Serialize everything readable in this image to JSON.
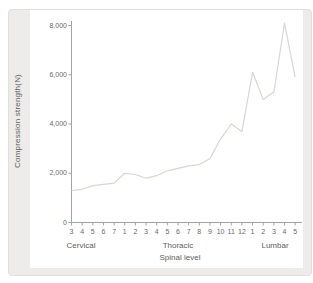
{
  "panel": {
    "background_color": "#edecea",
    "plot_background_color": "#ffffff"
  },
  "chart_data": {
    "type": "line",
    "title": "",
    "ylabel": "Compression strength(N)",
    "xlabel": "Spinal level",
    "ylim": [
      0,
      8220
    ],
    "yticks": [
      0,
      2000,
      4000,
      6000,
      8000
    ],
    "ytick_labels": [
      "0",
      "2,000",
      "4,000",
      "6,000",
      "8,000"
    ],
    "groups": [
      {
        "label": "Cervical",
        "ticks": [
          "3",
          "4",
          "5",
          "6",
          "7"
        ]
      },
      {
        "label": "Thoracic",
        "ticks": [
          "1",
          "2",
          "3",
          "4",
          "5",
          "6",
          "7",
          "8",
          "9",
          "10",
          "11",
          "12"
        ]
      },
      {
        "label": "Lumbar",
        "ticks": [
          "1",
          "2",
          "3",
          "4",
          "5"
        ]
      }
    ],
    "categories": [
      "C3",
      "C4",
      "C5",
      "C6",
      "C7",
      "T1",
      "T2",
      "T3",
      "T4",
      "T5",
      "T6",
      "T7",
      "T8",
      "T9",
      "T10",
      "T11",
      "T12",
      "L1",
      "L2",
      "L3",
      "L4",
      "L5"
    ],
    "values": [
      1300,
      1350,
      1500,
      1550,
      1600,
      2000,
      1950,
      1800,
      1900,
      2100,
      2200,
      2300,
      2350,
      2600,
      3400,
      4000,
      3700,
      6100,
      5000,
      5300,
      8100,
      5900
    ],
    "line_color": "#d9d6d0",
    "axis_color": "#a3a3a3",
    "legend": "none",
    "grid": "off"
  }
}
